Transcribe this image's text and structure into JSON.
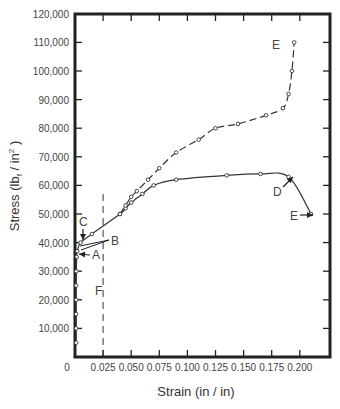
{
  "chart_data": {
    "type": "line",
    "title": "",
    "xlabel": "Strain (in / in)",
    "ylabel": "Stress (lbf / in²)",
    "ylabel_parts": {
      "main": "Stress (lb",
      "sub": "f",
      "mid": " / in",
      "sup": "2",
      "end": " )"
    },
    "xlim": [
      0,
      0.225
    ],
    "ylim": [
      0,
      120000
    ],
    "grid": false,
    "x_ticks": [
      0,
      0.025,
      0.05,
      0.075,
      0.1,
      0.125,
      0.15,
      0.175,
      0.2
    ],
    "x_tick_labels": [
      "0",
      "0.025",
      "0.050",
      "0.075",
      "0.100",
      "0.125",
      "0.150",
      "0.175",
      "0.200"
    ],
    "y_ticks": [
      10000,
      20000,
      30000,
      40000,
      50000,
      60000,
      70000,
      80000,
      90000,
      100000,
      110000,
      120000
    ],
    "y_tick_labels": [
      "10,000",
      "20,000",
      "30,000",
      "40,000",
      "50,000",
      "60,000",
      "70,000",
      "80,000",
      "90,000",
      "100,000",
      "110,000",
      "120,000"
    ],
    "series": [
      {
        "name": "Engineering stress-strain (solid)",
        "style": "solid",
        "x": [
          0.001,
          0.001,
          0.001,
          0.001,
          0.001,
          0.0012,
          0.0015,
          0.002,
          0.005,
          0.015,
          0.04,
          0.045,
          0.05,
          0.06,
          0.07,
          0.09,
          0.135,
          0.165,
          0.19,
          0.21
        ],
        "y": [
          5000,
          10000,
          15000,
          20000,
          25000,
          30000,
          35000,
          37000,
          40000,
          43000,
          50000,
          52000,
          54000,
          57000,
          60000,
          62000,
          63500,
          64000,
          63000,
          50000
        ]
      },
      {
        "name": "True stress-strain (dashed)",
        "style": "dashed",
        "x": [
          0.04,
          0.045,
          0.05,
          0.055,
          0.065,
          0.075,
          0.09,
          0.11,
          0.125,
          0.145,
          0.17,
          0.185,
          0.19,
          0.193,
          0.195
        ],
        "y": [
          50000,
          53000,
          56000,
          58000,
          62000,
          66000,
          71500,
          76000,
          80000,
          81500,
          84500,
          87000,
          92000,
          100000,
          110000
        ]
      }
    ],
    "annotations": [
      {
        "label": "A",
        "x": 0.001,
        "y": 36000,
        "note": "arrow pointing left to curve"
      },
      {
        "label": "B",
        "x": 0.032,
        "y": 41000,
        "note": "two lines to curve near yield"
      },
      {
        "label": "C",
        "x": 0.001,
        "y": 43000,
        "note": "arrow pointing down"
      },
      {
        "label": "D",
        "x": 0.19,
        "y": 63000,
        "note": "arrow pointing to max of solid curve"
      },
      {
        "label": "E",
        "x": 0.21,
        "y": 50000,
        "note": "fracture point, solid curve"
      },
      {
        "label": "E",
        "x": 0.195,
        "y": 110000,
        "note": "fracture point, dashed curve"
      },
      {
        "label": "F",
        "x": 0.025,
        "y": 22000,
        "note": "vertical dashed line at strain 0.025"
      }
    ],
    "reference_lines": [
      {
        "type": "vertical",
        "x": 0.025,
        "style": "dashed",
        "ymax": 57000,
        "label": "F"
      }
    ]
  }
}
